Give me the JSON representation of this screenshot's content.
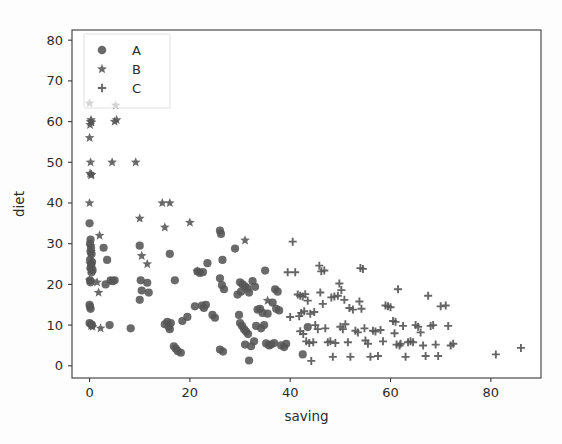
{
  "figure": {
    "background_color": "#fdfdfd",
    "marker_color": "#555555",
    "axis_color": "#3a3a3a"
  },
  "axes": {
    "x_title": "saving",
    "y_title": "diet",
    "x_ticks": [
      "0",
      "20",
      "40",
      "60",
      "80"
    ],
    "y_ticks": [
      "0",
      "10",
      "20",
      "30",
      "40",
      "50",
      "60",
      "70",
      "80"
    ]
  },
  "legend": {
    "entries": [
      {
        "label": "A",
        "marker": "circle-marker"
      },
      {
        "label": "B",
        "marker": "star-marker"
      },
      {
        "label": "C",
        "marker": "plus-marker"
      }
    ]
  },
  "chart_data": {
    "type": "scatter",
    "title": "",
    "xlabel": "saving",
    "ylabel": "diet",
    "xlim": [
      -3.5,
      90
    ],
    "ylim": [
      -3.0,
      82.5
    ],
    "xticks": [
      0,
      20,
      40,
      60,
      80
    ],
    "yticks": [
      0,
      10,
      20,
      30,
      40,
      50,
      60,
      70,
      80
    ],
    "grid": false,
    "legend_position": "upper-left",
    "series": [
      {
        "name": "A",
        "marker": "circle",
        "color": "#555555",
        "points": [
          [
            0.0,
            35.0
          ],
          [
            0.2,
            31.0
          ],
          [
            0.1,
            30.0
          ],
          [
            0.3,
            29.0
          ],
          [
            0.2,
            28.0
          ],
          [
            0.4,
            27.5
          ],
          [
            0.1,
            26.0
          ],
          [
            0.5,
            25.5
          ],
          [
            0.3,
            25.0
          ],
          [
            0.2,
            24.0
          ],
          [
            0.6,
            23.5
          ],
          [
            0.4,
            23.0
          ],
          [
            0.1,
            21.0
          ],
          [
            0.2,
            20.5
          ],
          [
            0.0,
            15.0
          ],
          [
            0.1,
            14.5
          ],
          [
            0.2,
            14.0
          ],
          [
            0.0,
            10.5
          ],
          [
            0.3,
            10.2
          ],
          [
            0.5,
            10.0
          ],
          [
            2.8,
            29.0
          ],
          [
            3.5,
            26.0
          ],
          [
            4.2,
            21.0
          ],
          [
            4.6,
            20.8
          ],
          [
            5.0,
            21.0
          ],
          [
            3.2,
            20.0
          ],
          [
            4.0,
            10.0
          ],
          [
            8.2,
            9.2
          ],
          [
            10.0,
            29.5
          ],
          [
            10.2,
            21.0
          ],
          [
            11.5,
            20.4
          ],
          [
            10.4,
            18.5
          ],
          [
            11.8,
            18.0
          ],
          [
            10.0,
            16.2
          ],
          [
            15.5,
            10.8
          ],
          [
            15.0,
            10.2
          ],
          [
            15.8,
            9.6
          ],
          [
            16.0,
            9.0
          ],
          [
            16.2,
            10.5
          ],
          [
            16.8,
            4.8
          ],
          [
            17.2,
            4.2
          ],
          [
            17.6,
            3.6
          ],
          [
            18.2,
            3.2
          ],
          [
            16.0,
            27.5
          ],
          [
            17.0,
            21.0
          ],
          [
            18.5,
            11.0
          ],
          [
            19.5,
            12.0
          ],
          [
            21.5,
            23.2
          ],
          [
            22.0,
            22.8
          ],
          [
            22.6,
            23.0
          ],
          [
            23.5,
            25.2
          ],
          [
            22.4,
            14.8
          ],
          [
            22.8,
            14.2
          ],
          [
            23.2,
            15.0
          ],
          [
            21.0,
            14.6
          ],
          [
            24.5,
            12.5
          ],
          [
            25.0,
            11.8
          ],
          [
            26.0,
            33.2
          ],
          [
            26.2,
            32.4
          ],
          [
            26.5,
            26.0
          ],
          [
            26.0,
            21.5
          ],
          [
            26.4,
            19.8
          ],
          [
            26.8,
            18.8
          ],
          [
            26.0,
            4.0
          ],
          [
            26.6,
            3.5
          ],
          [
            29.0,
            28.8
          ],
          [
            29.5,
            17.5
          ],
          [
            30.0,
            20.5
          ],
          [
            30.5,
            20.0
          ],
          [
            31.0,
            19.5
          ],
          [
            31.5,
            19.0
          ],
          [
            30.2,
            18.2
          ],
          [
            31.8,
            18.0
          ],
          [
            32.5,
            20.8
          ],
          [
            33.0,
            19.4
          ],
          [
            29.8,
            12.5
          ],
          [
            30.0,
            10.5
          ],
          [
            30.4,
            9.8
          ],
          [
            30.8,
            9.0
          ],
          [
            31.2,
            8.4
          ],
          [
            31.6,
            7.8
          ],
          [
            31.0,
            5.2
          ],
          [
            31.8,
            1.3
          ],
          [
            32.2,
            4.8
          ],
          [
            32.8,
            6.0
          ],
          [
            33.5,
            13.8
          ],
          [
            34.0,
            14.0
          ],
          [
            34.5,
            13.0
          ],
          [
            35.0,
            23.4
          ],
          [
            35.5,
            12.8
          ],
          [
            33.2,
            9.8
          ],
          [
            34.2,
            9.2
          ],
          [
            34.8,
            10.0
          ],
          [
            35.2,
            5.5
          ],
          [
            35.8,
            5.0
          ],
          [
            36.2,
            5.2
          ],
          [
            36.8,
            5.6
          ],
          [
            37.0,
            18.8
          ],
          [
            37.5,
            18.2
          ],
          [
            36.5,
            15.5
          ],
          [
            37.2,
            14.0
          ],
          [
            37.8,
            13.6
          ],
          [
            38.2,
            5.0
          ],
          [
            38.8,
            4.6
          ],
          [
            39.2,
            5.4
          ],
          [
            42.5,
            2.8
          ],
          [
            43.5,
            9.5
          ]
        ]
      },
      {
        "name": "B",
        "marker": "star",
        "color": "#555555",
        "points": [
          [
            0.0,
            64.5
          ],
          [
            0.2,
            60.0
          ],
          [
            0.4,
            59.8
          ],
          [
            0.1,
            59.2
          ],
          [
            0.3,
            60.4
          ],
          [
            0.0,
            56.0
          ],
          [
            0.2,
            50.0
          ],
          [
            0.1,
            47.2
          ],
          [
            0.4,
            47.0
          ],
          [
            0.3,
            46.8
          ],
          [
            0.0,
            40.0
          ],
          [
            0.2,
            29.5
          ],
          [
            0.3,
            28.0
          ],
          [
            0.1,
            25.0
          ],
          [
            0.4,
            24.2
          ],
          [
            0.2,
            23.5
          ],
          [
            0.0,
            21.0
          ],
          [
            0.5,
            20.8
          ],
          [
            0.3,
            9.8
          ],
          [
            0.6,
            9.6
          ],
          [
            5.2,
            64.0
          ],
          [
            5.4,
            60.4
          ],
          [
            5.0,
            60.0
          ],
          [
            4.5,
            50.0
          ],
          [
            9.2,
            50.0
          ],
          [
            2.0,
            32.0
          ],
          [
            1.5,
            20.5
          ],
          [
            1.8,
            18.0
          ],
          [
            2.2,
            9.2
          ],
          [
            10.0,
            36.2
          ],
          [
            10.4,
            27.0
          ],
          [
            11.5,
            25.0
          ],
          [
            14.5,
            40.0
          ],
          [
            16.0,
            40.0
          ],
          [
            15.0,
            34.0
          ],
          [
            20.0,
            35.2
          ],
          [
            21.5,
            23.2
          ],
          [
            31.0,
            30.8
          ],
          [
            35.5,
            16.0
          ]
        ]
      },
      {
        "name": "C",
        "marker": "plus",
        "color": "#555555",
        "points": [
          [
            40.5,
            30.5
          ],
          [
            41.0,
            23.0
          ],
          [
            41.5,
            17.5
          ],
          [
            42.0,
            17.2
          ],
          [
            42.5,
            17.0
          ],
          [
            41.8,
            12.2
          ],
          [
            42.2,
            13.0
          ],
          [
            42.8,
            13.4
          ],
          [
            43.0,
            17.6
          ],
          [
            43.5,
            16.0
          ],
          [
            42.0,
            8.5
          ],
          [
            42.6,
            7.8
          ],
          [
            43.2,
            6.0
          ],
          [
            43.8,
            5.6
          ],
          [
            44.2,
            1.2
          ],
          [
            44.6,
            5.8
          ],
          [
            45.0,
            10.0
          ],
          [
            45.5,
            9.0
          ],
          [
            44.0,
            12.8
          ],
          [
            44.8,
            13.2
          ],
          [
            45.8,
            24.6
          ],
          [
            46.2,
            23.2
          ],
          [
            46.8,
            23.4
          ],
          [
            46.0,
            18.0
          ],
          [
            46.5,
            15.2
          ],
          [
            47.0,
            9.2
          ],
          [
            47.5,
            5.8
          ],
          [
            48.0,
            6.0
          ],
          [
            48.5,
            2.2
          ],
          [
            49.0,
            5.6
          ],
          [
            48.2,
            16.8
          ],
          [
            48.8,
            17.0
          ],
          [
            49.5,
            17.2
          ],
          [
            49.8,
            20.2
          ],
          [
            50.2,
            18.6
          ],
          [
            50.0,
            9.6
          ],
          [
            50.5,
            9.0
          ],
          [
            51.0,
            10.2
          ],
          [
            51.5,
            5.8
          ],
          [
            52.0,
            2.2
          ],
          [
            50.8,
            16.2
          ],
          [
            51.8,
            14.2
          ],
          [
            52.5,
            13.8
          ],
          [
            53.0,
            8.6
          ],
          [
            53.5,
            8.2
          ],
          [
            54.0,
            24.0
          ],
          [
            54.5,
            23.8
          ],
          [
            53.8,
            15.8
          ],
          [
            54.2,
            14.0
          ],
          [
            54.8,
            9.2
          ],
          [
            55.0,
            6.2
          ],
          [
            55.5,
            5.4
          ],
          [
            56.0,
            2.2
          ],
          [
            56.5,
            8.6
          ],
          [
            57.0,
            8.4
          ],
          [
            57.5,
            2.4
          ],
          [
            58.0,
            8.8
          ],
          [
            58.5,
            6.0
          ],
          [
            59.0,
            14.8
          ],
          [
            59.5,
            14.6
          ],
          [
            60.0,
            14.4
          ],
          [
            60.5,
            11.0
          ],
          [
            61.0,
            10.8
          ],
          [
            61.5,
            18.8
          ],
          [
            60.8,
            8.0
          ],
          [
            61.2,
            5.2
          ],
          [
            61.8,
            5.0
          ],
          [
            62.0,
            5.4
          ],
          [
            62.5,
            9.8
          ],
          [
            63.0,
            2.2
          ],
          [
            63.5,
            5.8
          ],
          [
            64.0,
            6.0
          ],
          [
            64.5,
            5.8
          ],
          [
            65.0,
            10.0
          ],
          [
            65.5,
            9.6
          ],
          [
            66.0,
            8.2
          ],
          [
            66.5,
            5.0
          ],
          [
            67.0,
            2.4
          ],
          [
            67.5,
            17.2
          ],
          [
            68.0,
            9.8
          ],
          [
            68.5,
            10.0
          ],
          [
            69.0,
            5.2
          ],
          [
            69.5,
            2.4
          ],
          [
            70.0,
            14.6
          ],
          [
            71.0,
            14.8
          ],
          [
            71.5,
            9.8
          ],
          [
            72.0,
            5.0
          ],
          [
            72.5,
            5.4
          ],
          [
            39.5,
            23.0
          ],
          [
            40.0,
            12.0
          ],
          [
            81.0,
            2.8
          ],
          [
            86.0,
            4.4
          ]
        ]
      }
    ]
  }
}
